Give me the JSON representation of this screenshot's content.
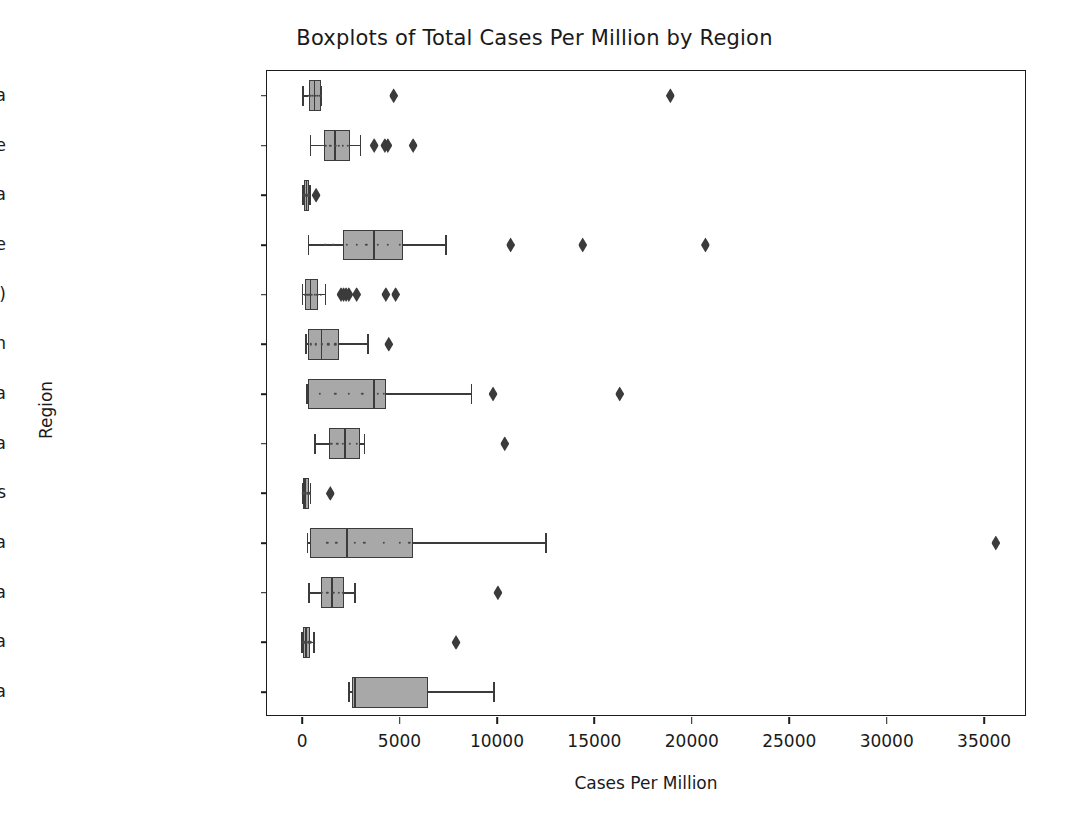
{
  "chart_data": {
    "type": "box",
    "title": "Boxplots of Total Cases Per Million by Region",
    "xlabel": "Cases Per Million",
    "ylabel": "Region",
    "orientation": "horizontal",
    "grid": false,
    "legend": "none",
    "xlim": [
      -1800,
      37200
    ],
    "xticks": [
      0,
      5000,
      10000,
      15000,
      20000,
      25000,
      30000,
      35000
    ],
    "xticklabels": [
      "0",
      "5000",
      "10000",
      "15000",
      "20000",
      "25000",
      "30000",
      "35000"
    ],
    "categories": [
      "South Asia",
      "Eastern Europe",
      "North Africa",
      "Western Europe",
      "Africa (other)",
      "Caribbean",
      "South America",
      "Central Asia",
      "Oceania / Aus",
      "West Asia",
      "Central America",
      "East Asia",
      "North America"
    ],
    "boxes": [
      {
        "category": "South Asia",
        "whisker_low": 60,
        "q1": 330,
        "median": 640,
        "q3": 950,
        "whisker_high": 960,
        "fliers": [
          4700,
          18900
        ],
        "points": [
          330,
          430,
          560,
          700,
          820,
          930
        ]
      },
      {
        "category": "Eastern Europe",
        "whisker_low": 440,
        "q1": 1140,
        "median": 1690,
        "q3": 2440,
        "whisker_high": 3000,
        "fliers": [
          3700,
          4250,
          4400,
          5700
        ],
        "points": [
          1200,
          1450,
          1700,
          1900,
          2100,
          2350
        ]
      },
      {
        "category": "North Africa",
        "whisker_low": 40,
        "q1": 120,
        "median": 230,
        "q3": 360,
        "whisker_high": 420,
        "fliers": [
          720
        ],
        "points": [
          120,
          180,
          250,
          310,
          350
        ]
      },
      {
        "category": "Western Europe",
        "whisker_low": 330,
        "q1": 2100,
        "median": 3700,
        "q3": 5200,
        "whisker_high": 7400,
        "fliers": [
          10700,
          14400,
          20700
        ],
        "points": [
          1200,
          1600,
          2300,
          2800,
          3300,
          3900,
          4400,
          5000
        ]
      },
      {
        "category": "Africa (other)",
        "whisker_low": 30,
        "q1": 170,
        "median": 430,
        "q3": 830,
        "whisker_high": 1200,
        "fliers": [
          2000,
          2130,
          2260,
          2400,
          2800,
          4300,
          4800
        ],
        "points": [
          150,
          260,
          380,
          500,
          640,
          780,
          950
        ]
      },
      {
        "category": "Caribbean",
        "whisker_low": 200,
        "q1": 320,
        "median": 1000,
        "q3": 1880,
        "whisker_high": 3400,
        "fliers": [
          4450
        ],
        "points": [
          450,
          700,
          1000,
          1350,
          1700
        ]
      },
      {
        "category": "South America",
        "whisker_low": 260,
        "q1": 290,
        "median": 3700,
        "q3": 4300,
        "whisker_high": 8700,
        "fliers": [
          9800,
          16300
        ],
        "points": [
          900,
          1700,
          2400,
          3100,
          3900,
          4200
        ]
      },
      {
        "category": "Central Asia",
        "whisker_low": 680,
        "q1": 1380,
        "median": 2200,
        "q3": 2980,
        "whisker_high": 3200,
        "fliers": [
          10400
        ],
        "points": [
          1500,
          1800,
          2100,
          2450,
          2800
        ]
      },
      {
        "category": "Oceania / Aus",
        "whisker_low": 20,
        "q1": 60,
        "median": 150,
        "q3": 340,
        "whisker_high": 430,
        "fliers": [
          1450
        ],
        "points": [
          50,
          120,
          200,
          290,
          380
        ]
      },
      {
        "category": "West Asia",
        "whisker_low": 280,
        "q1": 420,
        "median": 2300,
        "q3": 5700,
        "whisker_high": 12500,
        "fliers": [
          35600
        ],
        "points": [
          1300,
          1750,
          2700,
          3200,
          4200,
          5000,
          5500
        ]
      },
      {
        "category": "Central America",
        "whisker_low": 350,
        "q1": 980,
        "median": 1530,
        "q3": 2130,
        "whisker_high": 2700,
        "fliers": [
          10050
        ],
        "points": [
          1000,
          1300,
          1600,
          1900,
          2100
        ]
      },
      {
        "category": "East Asia",
        "whisker_low": 10,
        "q1": 60,
        "median": 210,
        "q3": 420,
        "whisker_high": 600,
        "fliers": [
          7900
        ],
        "points": [
          60,
          150,
          250,
          340,
          430
        ]
      },
      {
        "category": "North America",
        "whisker_low": 2400,
        "q1": 2560,
        "median": 2700,
        "q3": 6450,
        "whisker_high": 9850,
        "fliers": [],
        "points": []
      }
    ]
  },
  "style": {
    "box_fill": "#a8a8a8",
    "box_edge": "#3b3b3b",
    "frame_color": "#1c1c1c",
    "text_color": "#1a1a1a",
    "background": "#ffffff"
  }
}
